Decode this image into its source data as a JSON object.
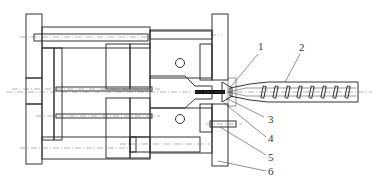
{
  "diagram": {
    "colors": {
      "line": "#333333",
      "background": "#ffffff",
      "label": "#333333"
    },
    "labels": [
      {
        "id": "1",
        "text": "1"
      },
      {
        "id": "2",
        "text": "2"
      },
      {
        "id": "3",
        "text": "3"
      },
      {
        "id": "4",
        "text": "4"
      },
      {
        "id": "5",
        "text": "5"
      },
      {
        "id": "6",
        "text": "6"
      }
    ]
  }
}
